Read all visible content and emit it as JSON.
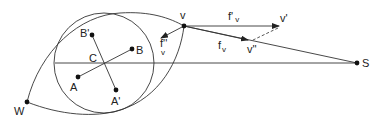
{
  "colors": {
    "stroke": "#333333",
    "point": "#111111",
    "background": "#ffffff"
  },
  "points": {
    "v": {
      "label": "v",
      "x": 184,
      "y": 26
    },
    "v_prime": {
      "label": "v'",
      "x": 279,
      "y": 26
    },
    "v_double_prime": {
      "label": "v''",
      "x": 248,
      "y": 40
    },
    "S": {
      "label": "S",
      "x": 357,
      "y": 63
    },
    "W": {
      "label": "W",
      "x": 27,
      "y": 102
    },
    "A": {
      "label": "A",
      "x": 78,
      "y": 77
    },
    "B": {
      "label": "B",
      "x": 132,
      "y": 49
    },
    "A_prime": {
      "label": "A'",
      "x": 116,
      "y": 90
    },
    "B_prime": {
      "label": "B'",
      "x": 92,
      "y": 35
    },
    "C": {
      "label": "C",
      "x": 104,
      "y": 63
    }
  },
  "labels": {
    "f_prime_v": {
      "main": "f'",
      "sub": "v"
    },
    "f_v": {
      "main": "f",
      "sub": "v"
    },
    "f_double_prime_v": {
      "main": "f''",
      "sub": "v"
    }
  },
  "circle": {
    "cx": 104,
    "cy": 63,
    "r": 50
  }
}
